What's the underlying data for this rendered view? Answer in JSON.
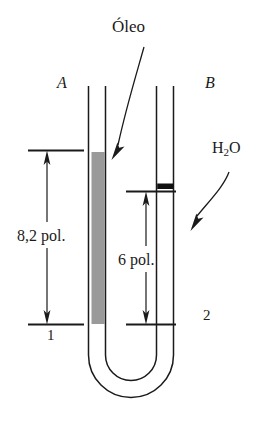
{
  "figure": {
    "type": "u-tube-manometer-diagram",
    "width": 267,
    "height": 433,
    "background_color": "#ffffff",
    "line_color": "#1a1a1a",
    "oil_fill_color": "#9a9a9a",
    "water_band_color": "#101010"
  },
  "labels": {
    "fluid_oil": "Óleo",
    "tube_left": "A",
    "tube_right": "B",
    "fluid_water": "H",
    "fluid_water_sub": "2",
    "fluid_water_tail": "O",
    "dimension_left": "8,2 pol.",
    "dimension_middle": "6 pol.",
    "point_left": "1",
    "point_right": "2"
  },
  "measurements": {
    "oil_column_height": "8,2 pol.",
    "water_column_height": "6 pol.",
    "unit": "pol."
  },
  "annotations": [
    {
      "name": "oleo-leader",
      "label": "Óleo",
      "points_to": "oil-column"
    },
    {
      "name": "h2o-leader",
      "label": "H2O",
      "points_to": "water-level-band"
    }
  ]
}
